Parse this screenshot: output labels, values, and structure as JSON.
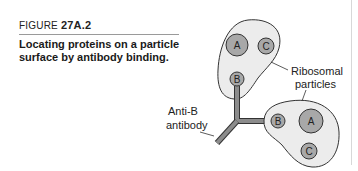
{
  "figure": {
    "label_prefix": "FIGURE",
    "label_number": "27A.2",
    "caption_line1": "Locating proteins on a particle",
    "caption_line2": "surface by antibody binding."
  },
  "diagram": {
    "labels": {
      "ribosomal_line1": "Ribosomal",
      "ribosomal_line2": "particles",
      "antibody_line1": "Anti-B",
      "antibody_line2": "antibody"
    },
    "upper_particle": {
      "proteins": [
        "A",
        "C",
        "B"
      ]
    },
    "lower_particle": {
      "proteins": [
        "B",
        "A",
        "C"
      ]
    },
    "colors": {
      "particle_fill": "#ececec",
      "protein_fill": "#a8a8a8",
      "outline": "#333333",
      "antibody": "#8c8c8c"
    }
  }
}
